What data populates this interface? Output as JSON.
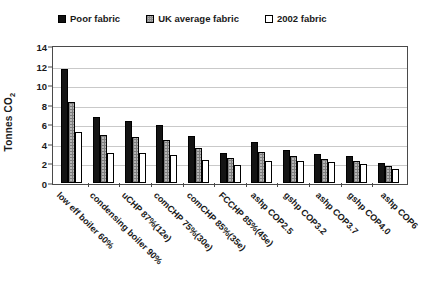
{
  "chart_data": {
    "type": "bar",
    "title": "",
    "xlabel": "",
    "ylabel": "Tonnes CO2",
    "ylabel_display": "Tonnes CO",
    "ylabel_sub": "2",
    "ylim": [
      0,
      14
    ],
    "ytick_step": 2,
    "yticks": [
      0,
      2,
      4,
      6,
      8,
      10,
      12,
      14
    ],
    "grid": true,
    "legend_position": "top",
    "categories": [
      "low eff boiler 60%",
      "condensing boiler 90%",
      "uCHP 87%(12e)",
      "comCHP 75%(30e)",
      "comCHP 85%(35e)",
      "FCCHP 85%(45e)",
      "ashp COP2.5",
      "gshp COP3.2",
      "ashp COP3.7",
      "gshp COP4.0",
      "ashp COP6"
    ],
    "series": [
      {
        "name": "Poor fabric",
        "color": "#141414",
        "values": [
          11.7,
          6.7,
          6.3,
          5.9,
          4.8,
          3.1,
          4.2,
          3.4,
          3.0,
          2.8,
          2.0
        ]
      },
      {
        "name": "UK average fabric",
        "color": "#b5b5b5",
        "values": [
          8.3,
          4.9,
          4.7,
          4.4,
          3.6,
          2.6,
          3.2,
          2.8,
          2.5,
          2.3,
          1.7
        ]
      },
      {
        "name": "2002 fabric",
        "color": "#ffffff",
        "values": [
          5.2,
          3.1,
          3.1,
          2.9,
          2.4,
          1.8,
          2.2,
          2.3,
          2.1,
          1.9,
          1.4
        ]
      }
    ]
  },
  "legend": {
    "items": [
      {
        "label": "Poor fabric",
        "swatch": "poor-fabric-swatch"
      },
      {
        "label": "UK average fabric",
        "swatch": "uk-average-fabric-swatch"
      },
      {
        "label": "2002 fabric",
        "swatch": "2002-fabric-swatch"
      }
    ]
  }
}
